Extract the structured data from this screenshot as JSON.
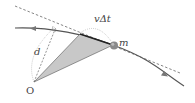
{
  "diagram": {
    "labels": {
      "origin": "O",
      "mass": "m",
      "displacement": "vΔt",
      "distance": "d"
    },
    "colors": {
      "curve": "#555555",
      "tangent": "#666666",
      "triangle_fill": "#c8c8c8",
      "triangle_stroke": "#444444",
      "ball": "#8a8a8a"
    },
    "points": {
      "O": [
        34,
        82
      ],
      "A": [
        80,
        34
      ],
      "m": [
        113,
        45
      ],
      "perp_foot": [
        56,
        27
      ]
    }
  }
}
